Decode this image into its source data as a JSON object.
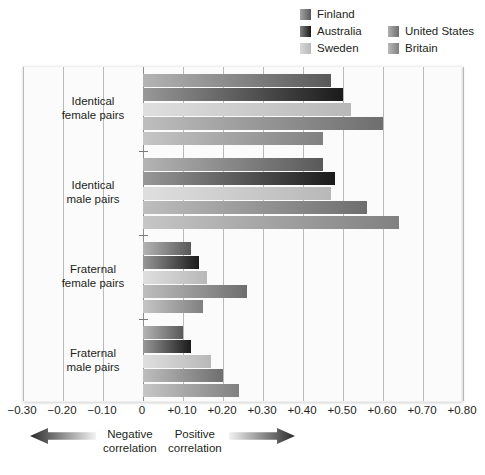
{
  "legend": {
    "entries": [
      {
        "label": "Finland",
        "color": "#595959",
        "swatch_name": "legend-swatch-finland"
      },
      {
        "label": "Australia",
        "color": "#1a1a1a",
        "swatch_name": "legend-swatch-australia"
      },
      {
        "label": "Sweden",
        "color": "#b8b8b8",
        "swatch_name": "legend-swatch-sweden"
      },
      {
        "label": "United States",
        "color": "#6e6e6e",
        "swatch_name": "legend-swatch-united-states"
      },
      {
        "label": "Britain",
        "color": "#808080",
        "swatch_name": "legend-swatch-britain"
      }
    ]
  },
  "axis": {
    "ticks": [
      {
        "label": "−0.30",
        "value": -0.3
      },
      {
        "label": "−0.20",
        "value": -0.2
      },
      {
        "label": "−0.10",
        "value": -0.1
      },
      {
        "label": "0",
        "value": 0.0
      },
      {
        "label": "+0.10",
        "value": 0.1
      },
      {
        "label": "+0.20",
        "value": 0.2
      },
      {
        "label": "+0.30",
        "value": 0.3
      },
      {
        "label": "+0.40",
        "value": 0.4
      },
      {
        "label": "+0.50",
        "value": 0.5
      },
      {
        "label": "+0.60",
        "value": 0.6
      },
      {
        "label": "+0.70",
        "value": 0.7
      },
      {
        "label": "+0.80",
        "value": 0.8
      }
    ]
  },
  "footer": {
    "negative": {
      "line1": "Negative",
      "line2": "correlation",
      "arrow": "arrow-left-icon"
    },
    "positive": {
      "line1": "Positive",
      "line2": "correlation",
      "arrow": "arrow-right-icon"
    }
  },
  "chart_data": {
    "type": "bar",
    "orientation": "horizontal",
    "title": "",
    "subtitle": "",
    "xlabel": "",
    "ylabel": "",
    "xlim": [
      -0.3,
      0.8
    ],
    "grid": true,
    "legend_position": "top-right",
    "categories": [
      "Identical female pairs",
      "Identical male pairs",
      "Fraternal female pairs",
      "Fraternal male pairs"
    ],
    "category_lines": [
      [
        "Identical",
        "female pairs"
      ],
      [
        "Identical",
        "male pairs"
      ],
      [
        "Fraternal",
        "female pairs"
      ],
      [
        "Fraternal",
        "male pairs"
      ]
    ],
    "series": [
      {
        "name": "Finland",
        "color": "#595959",
        "values": [
          0.47,
          0.45,
          0.12,
          0.1
        ]
      },
      {
        "name": "Australia",
        "color": "#1a1a1a",
        "values": [
          0.5,
          0.48,
          0.14,
          0.12
        ]
      },
      {
        "name": "Sweden",
        "color": "#b8b8b8",
        "values": [
          0.52,
          0.47,
          0.16,
          0.17
        ]
      },
      {
        "name": "United States",
        "color": "#6e6e6e",
        "values": [
          0.6,
          0.56,
          0.26,
          0.2
        ]
      },
      {
        "name": "Britain",
        "color": "#808080",
        "values": [
          0.45,
          0.64,
          0.15,
          0.24
        ]
      }
    ]
  }
}
